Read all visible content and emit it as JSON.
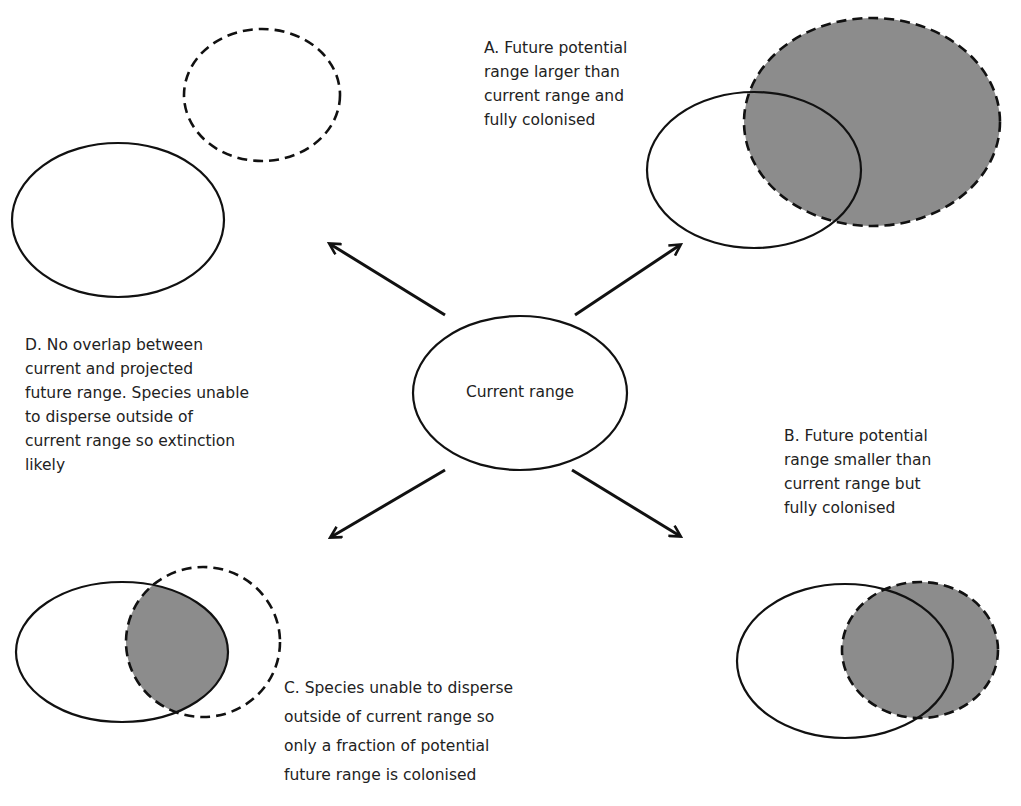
{
  "figure": {
    "center": {
      "label": "Current range"
    },
    "scenarios": [
      {
        "id": "A",
        "caption": "A. Future potential\nrange larger than\ncurrent range and\nfully colonised"
      },
      {
        "id": "B",
        "caption": "B. Future potential\nrange smaller than\ncurrent range but\nfully colonised"
      },
      {
        "id": "C",
        "caption": "C. Species unable to disperse\noutside of current range so\nonly a fraction of potential\nfuture range is colonised"
      },
      {
        "id": "D",
        "caption": "D. No overlap between\ncurrent and projected\nfuture range. Species unable\nto disperse outside of\ncurrent range so extinction\nlikely"
      }
    ],
    "legend_semantics": {
      "solid_ellipse": "current range",
      "dashed_ellipse": "future potential range",
      "gray_fill": "colonised area"
    },
    "colors": {
      "stroke": "#111111",
      "fill_colonised": "#8c8c8c",
      "background": "#ffffff"
    }
  }
}
